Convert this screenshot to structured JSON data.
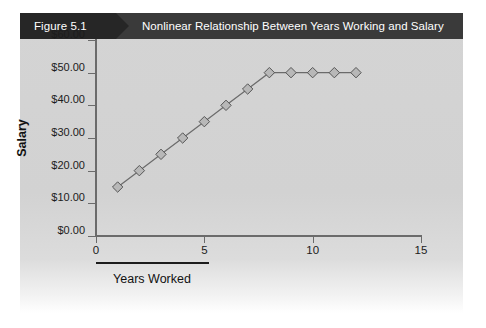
{
  "figure": {
    "tag_label": "Figure 5.1",
    "title": "Nonlinear Relationship Between Years Working and Salary",
    "header_bg": "#3a3a3a",
    "tag_bg": "#262626",
    "panel_bg": "#d3d3d3"
  },
  "chart_data": {
    "type": "line",
    "title": "Nonlinear Relationship Between Years Working and Salary",
    "xlabel": "Years Worked",
    "ylabel": "Salary",
    "x": [
      1,
      2,
      3,
      4,
      5,
      6,
      7,
      8,
      9,
      10,
      11,
      12
    ],
    "values": [
      15,
      20,
      25,
      30,
      35,
      40,
      45,
      50,
      50,
      50,
      50,
      50
    ],
    "series": [
      {
        "name": "Salary",
        "values": [
          15,
          20,
          25,
          30,
          35,
          40,
          45,
          50,
          50,
          50,
          50,
          50
        ]
      }
    ],
    "xlim": [
      0,
      15
    ],
    "ylim": [
      0,
      60
    ],
    "xticks": [
      0,
      5,
      10,
      15
    ],
    "xtick_labels": [
      "0",
      "5",
      "10",
      "15"
    ],
    "yticks": [
      0,
      10,
      20,
      30,
      40,
      50,
      60
    ],
    "ytick_labels": [
      "$0.00",
      "$10.00",
      "$20.00",
      "$30.00",
      "$40.00",
      "$50.00",
      "$60.00"
    ],
    "grid": false,
    "legend": null,
    "marker": "diamond",
    "marker_color": "#b8b8b8",
    "marker_edge_color": "#555555",
    "line_color": "#6b6b6b",
    "axis_color": "#6b6b6b"
  }
}
